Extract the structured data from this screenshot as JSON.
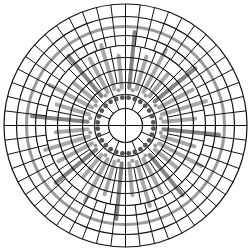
{
  "figure": {
    "width": 251,
    "height": 251,
    "center": [
      125.5,
      125.5
    ],
    "background": "#ffffff",
    "line_color": "#111111",
    "gray_color": "#9a9a9a",
    "dark_gray_color": "#6e6e6e",
    "dot_color": "#555555",
    "rings": [
      17,
      31,
      43,
      56,
      68,
      80,
      90,
      109,
      121.5
    ],
    "gray_ring": {
      "radius": 99,
      "width": 3
    },
    "bands": [
      {
        "r_inner": 17,
        "r_outer": 43,
        "spokes": 16
      },
      {
        "r_inner": 43,
        "r_outer": 80,
        "spokes": 32
      },
      {
        "r_inner": 80,
        "r_outer": 121.5,
        "spokes": 52
      }
    ],
    "crosshair": true,
    "gray_bars": {
      "count": 32,
      "r_start": 38,
      "r_end_pattern": [
        94,
        72,
        86,
        66,
        90,
        76,
        84,
        70
      ],
      "width": 4
    },
    "dot_ring": {
      "radius": 28,
      "count": 28,
      "dot_radius": 2.4
    },
    "inner_dots": {
      "radius": 36,
      "count": 16,
      "dot_radius": 2.0
    }
  }
}
